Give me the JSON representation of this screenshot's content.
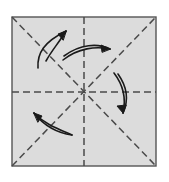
{
  "figure": {
    "background_color": "#ffffff"
  },
  "paper": {
    "name": "square-sheet",
    "fill_color": "#dcdcdc",
    "border_color": "#555555",
    "border_width": 1.4,
    "x": 12,
    "y": 17,
    "width": 144,
    "height": 149
  },
  "fold_lines": {
    "color": "#4a4a4a",
    "width": 1.5,
    "dash_pattern": "7 4",
    "items": [
      {
        "name": "fold-line-vertical",
        "label": "Vertical center fold",
        "x1": 84,
        "y1": 17,
        "x2": 84,
        "y2": 166
      },
      {
        "name": "fold-line-horizontal",
        "label": "Horizontal center fold",
        "x1": 12,
        "y1": 92,
        "x2": 156,
        "y2": 92
      },
      {
        "name": "fold-line-diagonal-nwse",
        "label": "Diagonal fold top-left to bottom-right",
        "x1": 12,
        "y1": 17,
        "x2": 156,
        "y2": 166
      },
      {
        "name": "fold-line-diagonal-swne",
        "label": "Diagonal fold bottom-left to top-right",
        "x1": 12,
        "y1": 166,
        "x2": 156,
        "y2": 17
      }
    ]
  },
  "arrows": {
    "color": "#1a1a1a",
    "width": 1.6,
    "items": [
      {
        "name": "arrow-upper-left",
        "label": "Curved arrow pointing up-right in upper-left quadrant",
        "direction": "up-right",
        "path_main": "M 38 68 C 37 53 44 42 66 31",
        "path_secondary": "M 46 61 C 52 50 58 44 66 31",
        "head": "M 66 31 L 58 34 L 63 40 Z"
      },
      {
        "name": "arrow-top-arc",
        "label": "Horizontal arc arrow pointing right above center",
        "direction": "right",
        "path_main": "M 63 60 C 78 48 96 46 110 49",
        "path_secondary": "M 64 56 C 80 44 98 43 110 49",
        "head": "M 110 49 L 101 45 L 102 52 Z"
      },
      {
        "name": "arrow-right-arc",
        "label": "Vertical arc arrow pointing down on right side",
        "direction": "down",
        "path_main": "M 114 73 C 124 86 126 100 123 113",
        "path_secondary": "M 118 74 C 128 88 128 102 123 113",
        "head": "M 123 113 L 117 106 L 126 105 Z"
      },
      {
        "name": "arrow-lower-left",
        "label": "Curved arrow pointing up-left in lower-left quadrant",
        "direction": "up-left",
        "path_main": "M 72 135 C 58 133 45 127 34 113",
        "path_secondary": "M 72 135 C 56 128 45 124 34 113",
        "head": "M 34 113 L 42 116 L 38 122 Z"
      }
    ]
  }
}
